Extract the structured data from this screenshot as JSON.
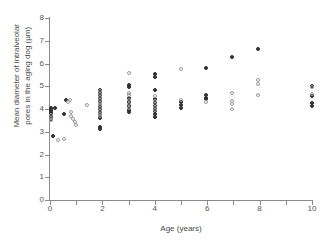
{
  "chart_data": {
    "type": "scatter",
    "title": "",
    "xlabel": "Age (years)",
    "ylabel": "Mean diameter of intralveolar pores in the aging dog (µm)",
    "xlim": [
      0,
      10
    ],
    "ylim": [
      0,
      8
    ],
    "xticks": [
      0,
      1,
      2,
      3,
      4,
      5,
      6,
      7,
      8,
      9,
      10
    ],
    "xtick_labels": [
      "0",
      "",
      "2",
      "",
      "4",
      "",
      "6",
      "",
      "8",
      "",
      "10"
    ],
    "yticks": [
      0,
      1,
      2,
      3,
      4,
      5,
      6,
      7,
      8
    ],
    "ytick_labels": [
      "0",
      "1",
      "2",
      "3",
      "4",
      "5",
      "6",
      "7",
      "8"
    ],
    "grid": false,
    "legend": null,
    "legend_position": "none",
    "series": [
      {
        "name": "filled",
        "marker": "filled-circle",
        "color": "#3b3b3b",
        "points": [
          [
            0.05,
            4.05
          ],
          [
            0.18,
            4.05
          ],
          [
            0.05,
            3.95
          ],
          [
            0.05,
            3.85
          ],
          [
            0.05,
            3.78
          ],
          [
            0.05,
            3.7
          ],
          [
            0.05,
            3.62
          ],
          [
            0.05,
            3.55
          ],
          [
            0.1,
            2.8
          ],
          [
            0.55,
            3.78
          ],
          [
            0.62,
            4.4
          ],
          [
            1.92,
            4.85
          ],
          [
            1.92,
            4.72
          ],
          [
            1.92,
            4.6
          ],
          [
            1.92,
            4.48
          ],
          [
            1.92,
            4.35
          ],
          [
            1.92,
            4.22
          ],
          [
            1.92,
            4.1
          ],
          [
            1.92,
            3.98
          ],
          [
            1.92,
            3.85
          ],
          [
            1.92,
            3.72
          ],
          [
            1.92,
            3.6
          ],
          [
            1.92,
            3.2
          ],
          [
            1.92,
            3.12
          ],
          [
            3.0,
            5.05
          ],
          [
            3.0,
            4.95
          ],
          [
            3.0,
            4.48
          ],
          [
            3.0,
            4.3
          ],
          [
            3.0,
            4.12
          ],
          [
            3.0,
            3.95
          ],
          [
            3.0,
            3.86
          ],
          [
            4.0,
            5.55
          ],
          [
            4.0,
            5.4
          ],
          [
            4.0,
            4.85
          ],
          [
            4.0,
            4.42
          ],
          [
            4.0,
            4.28
          ],
          [
            4.0,
            4.15
          ],
          [
            4.0,
            4.02
          ],
          [
            4.0,
            3.9
          ],
          [
            4.0,
            3.78
          ],
          [
            4.0,
            3.66
          ],
          [
            5.0,
            4.3
          ],
          [
            5.0,
            4.18
          ],
          [
            5.0,
            4.05
          ],
          [
            5.95,
            5.8
          ],
          [
            5.95,
            4.6
          ],
          [
            5.95,
            4.5
          ],
          [
            5.95,
            4.42
          ],
          [
            6.95,
            6.3
          ],
          [
            7.95,
            6.65
          ],
          [
            10.0,
            5.02
          ],
          [
            10.0,
            4.58
          ],
          [
            10.0,
            4.25
          ],
          [
            10.0,
            4.15
          ]
        ]
      },
      {
        "name": "open",
        "marker": "open-circle",
        "color": "#9a9a9a",
        "points": [
          [
            0.05,
            3.72
          ],
          [
            0.05,
            3.6
          ],
          [
            0.05,
            3.5
          ],
          [
            0.3,
            2.62
          ],
          [
            0.52,
            2.68
          ],
          [
            0.68,
            4.3
          ],
          [
            0.82,
            3.88
          ],
          [
            0.8,
            3.7
          ],
          [
            0.88,
            3.55
          ],
          [
            0.95,
            3.42
          ],
          [
            0.98,
            3.3
          ],
          [
            0.78,
            4.38
          ],
          [
            1.42,
            4.18
          ],
          [
            1.92,
            4.78
          ],
          [
            1.92,
            4.65
          ],
          [
            1.92,
            4.52
          ],
          [
            1.92,
            4.4
          ],
          [
            1.92,
            4.28
          ],
          [
            1.92,
            4.16
          ],
          [
            1.92,
            4.04
          ],
          [
            1.92,
            3.92
          ],
          [
            1.92,
            3.8
          ],
          [
            1.92,
            3.68
          ],
          [
            3.0,
            5.6
          ],
          [
            3.0,
            4.72
          ],
          [
            3.0,
            4.6
          ],
          [
            3.0,
            4.4
          ],
          [
            3.0,
            4.22
          ],
          [
            3.0,
            4.04
          ],
          [
            4.0,
            4.55
          ],
          [
            4.0,
            4.35
          ],
          [
            4.0,
            4.2
          ],
          [
            4.0,
            4.08
          ],
          [
            4.0,
            3.96
          ],
          [
            5.0,
            5.78
          ],
          [
            5.0,
            4.38
          ],
          [
            5.95,
            4.32
          ],
          [
            6.95,
            4.72
          ],
          [
            6.95,
            4.35
          ],
          [
            6.95,
            4.22
          ],
          [
            6.95,
            3.98
          ],
          [
            7.95,
            5.28
          ],
          [
            7.95,
            5.08
          ],
          [
            7.95,
            4.62
          ],
          [
            10.0,
            4.95
          ],
          [
            10.0,
            4.68
          ]
        ]
      }
    ]
  },
  "axes": {
    "y_title": "Mean diameter of intralveolar\npores in the aging dog (µm)",
    "y_title_line1": "Mean diameter of intralveolar",
    "y_title_line2": "pores in the aging dog (µm)",
    "x_title": "Age (years)"
  }
}
